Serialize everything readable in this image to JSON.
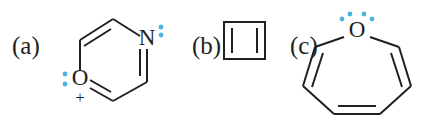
{
  "figure": {
    "background_color": "#ffffff",
    "bond_color": "#231f20",
    "lone_pair_color": "#4cb3e0",
    "structures": [
      {
        "label": "(a)",
        "name": "oxygen-containing-six-membered-ring-cation",
        "ring_size": 6,
        "atoms": [
          {
            "symbol": "O",
            "charge": "+",
            "lone_pairs": 1
          },
          {
            "symbol": "N",
            "charge": "",
            "lone_pairs": 1
          }
        ],
        "oxygen_symbol": "O",
        "oxygen_charge": "+",
        "nitrogen_symbol": "N",
        "double_bond_count": 3
      },
      {
        "label": "(b)",
        "name": "cyclobutadiene-square",
        "ring_size": 4,
        "atoms": [],
        "double_bond_count": 2
      },
      {
        "label": "(c)",
        "name": "oxepine-seven-membered-ring",
        "ring_size": 7,
        "atoms": [
          {
            "symbol": "O",
            "charge": "",
            "lone_pairs": 2
          }
        ],
        "oxygen_symbol": "O",
        "double_bond_count": 3
      }
    ]
  }
}
